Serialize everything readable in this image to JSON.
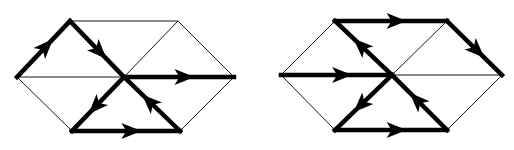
{
  "figure": {
    "colors": {
      "background": "#ffffff",
      "thin_edge": "#1a1a1a",
      "thick_edge": "#000000"
    }
  },
  "diagrams": [
    {
      "id": "left-hexagon",
      "vertices": {
        "L": [
          17,
          77
        ],
        "TL": [
          70,
          21
        ],
        "TR": [
          178,
          21
        ],
        "R": [
          234,
          77
        ],
        "BR": [
          180,
          131
        ],
        "BL": [
          72,
          131
        ],
        "C": [
          124,
          77
        ]
      },
      "thin_edges": [
        [
          "L",
          "TL"
        ],
        [
          "TL",
          "TR"
        ],
        [
          "TR",
          "R"
        ],
        [
          "R",
          "BR"
        ],
        [
          "BR",
          "BL"
        ],
        [
          "BL",
          "L"
        ],
        [
          "L",
          "C"
        ],
        [
          "C",
          "TR"
        ],
        [
          "C",
          "BR"
        ]
      ],
      "directed_edges": [
        {
          "from": "L",
          "to": "TL"
        },
        {
          "from": "TL",
          "to": "C"
        },
        {
          "from": "C",
          "to": "R"
        },
        {
          "from": "C",
          "to": "BL"
        },
        {
          "from": "BL",
          "to": "BR"
        },
        {
          "from": "BR",
          "to": "C"
        }
      ]
    },
    {
      "id": "right-hexagon",
      "vertices": {
        "L": [
          281,
          75
        ],
        "TL": [
          335,
          21
        ],
        "TR": [
          447,
          21
        ],
        "R": [
          502,
          75
        ],
        "BR": [
          447,
          130
        ],
        "BL": [
          335,
          130
        ],
        "C": [
          392,
          75
        ]
      },
      "thin_edges": [
        [
          "L",
          "TL"
        ],
        [
          "TL",
          "TR"
        ],
        [
          "TR",
          "R"
        ],
        [
          "R",
          "BR"
        ],
        [
          "BR",
          "BL"
        ],
        [
          "BL",
          "L"
        ],
        [
          "C",
          "R"
        ],
        [
          "C",
          "TR"
        ],
        [
          "C",
          "BR"
        ]
      ],
      "directed_edges": [
        {
          "from": "L",
          "to": "C"
        },
        {
          "from": "C",
          "to": "TL"
        },
        {
          "from": "TL",
          "to": "TR"
        },
        {
          "from": "TR",
          "to": "R"
        },
        {
          "from": "C",
          "to": "BL"
        },
        {
          "from": "BL",
          "to": "BR"
        },
        {
          "from": "BR",
          "to": "C"
        }
      ]
    }
  ]
}
